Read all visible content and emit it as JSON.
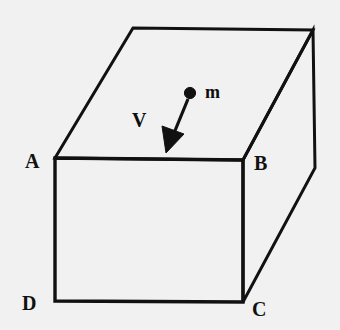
{
  "figure": {
    "background_color": "#f1f1f1",
    "line_color": "#111111",
    "line_width": 3,
    "width": 340,
    "height": 330
  },
  "labels": {
    "vertex_a": "A",
    "vertex_b": "B",
    "vertex_c": "C",
    "vertex_d": "D",
    "mass": "m",
    "velocity": "V"
  },
  "geometry": {
    "vertices": {
      "front_top_left": [
        55,
        158
      ],
      "front_top_right": [
        243,
        160
      ],
      "front_bottom_right": [
        243,
        302
      ],
      "front_bottom_left": [
        55,
        301
      ],
      "back_top_left": [
        133,
        28
      ],
      "back_top_right": [
        313,
        30
      ],
      "back_bottom_right": [
        315,
        168
      ]
    },
    "front_face_path": "M 55 158 L 243 160 L 243 302 L 55 301 Z",
    "top_face_path": "M 55 158 L 133 28 L 313 30 L 243 160 Z",
    "right_face_path": "M 243 160 L 313 30 L 315 168 L 243 302 Z",
    "mass_point": {
      "cx": 190,
      "cy": 93,
      "r": 5.5
    },
    "velocity_arrow": {
      "from": [
        188,
        98
      ],
      "to": [
        166,
        152
      ],
      "head_length": 22,
      "head_width": 15
    }
  }
}
